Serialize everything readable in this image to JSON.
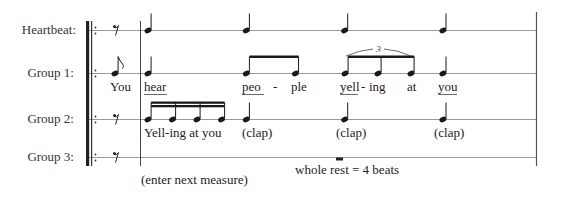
{
  "rows": [
    {
      "id": "heartbeat",
      "label": "Heartbeat:"
    },
    {
      "id": "group1",
      "label": "Group 1:"
    },
    {
      "id": "group2",
      "label": "Group 2:"
    },
    {
      "id": "group3",
      "label": "Group 3:"
    }
  ],
  "heartbeat": {
    "pickup": "eighth-rest",
    "notes": [
      {
        "type": "quarter",
        "beat": 1
      },
      {
        "type": "quarter",
        "beat": 2
      },
      {
        "type": "quarter",
        "beat": 3
      },
      {
        "type": "quarter",
        "beat": 4
      }
    ]
  },
  "group1": {
    "pickup": {
      "type": "eighth",
      "lyric": "You"
    },
    "notes": [
      {
        "type": "quarter",
        "beat": 1,
        "lyric": "hear",
        "stressed": true
      },
      {
        "type": "eighth",
        "beat": 2,
        "lyric": "peo",
        "stressed": true
      },
      {
        "type": "eighth",
        "beat": 2.5,
        "lyric": "ple"
      },
      {
        "type": "triplet-eighth",
        "beat": 3,
        "lyric": "yell",
        "stressed": true
      },
      {
        "type": "triplet-eighth",
        "beat": 3.333,
        "lyric": "ing"
      },
      {
        "type": "triplet-eighth",
        "beat": 3.667,
        "lyric": "at"
      },
      {
        "type": "quarter",
        "beat": 4,
        "lyric": "you",
        "stressed": true
      }
    ],
    "hyphen": "-",
    "tuplet_number": "3"
  },
  "group2": {
    "pickup": "eighth-rest",
    "notes": [
      {
        "type": "sixteenth",
        "beat": 1,
        "lyric": "Yell"
      },
      {
        "type": "sixteenth",
        "beat": 1.25,
        "lyric": "ing"
      },
      {
        "type": "sixteenth",
        "beat": 1.5,
        "lyric": "at"
      },
      {
        "type": "sixteenth",
        "beat": 1.75,
        "lyric": "you"
      },
      {
        "type": "quarter",
        "beat": 2,
        "lyric": "(clap)"
      },
      {
        "type": "quarter",
        "beat": 3,
        "lyric": "(clap)"
      },
      {
        "type": "quarter",
        "beat": 4,
        "lyric": "(clap)"
      }
    ],
    "lyric_line": "Yell-ing at you"
  },
  "group3": {
    "pickup": "eighth-rest",
    "rest": "whole-rest",
    "annotation_enter": "(enter next measure)",
    "annotation_rest": "whole rest = 4 beats"
  }
}
